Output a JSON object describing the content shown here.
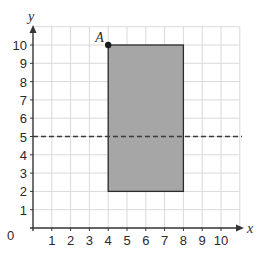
{
  "diagram": {
    "type": "coordinate-grid",
    "x_axis": {
      "label": "x",
      "min": 0,
      "max": 10,
      "ticks": [
        "1",
        "2",
        "3",
        "4",
        "5",
        "6",
        "7",
        "8",
        "9",
        "10"
      ]
    },
    "y_axis": {
      "label": "y",
      "min": 0,
      "max": 10,
      "ticks": [
        "1",
        "2",
        "3",
        "4",
        "5",
        "6",
        "7",
        "8",
        "9",
        "10"
      ]
    },
    "origin_label": "0",
    "grid_extent": {
      "x": 11,
      "y": 11
    },
    "rectangle": {
      "x1": 4,
      "y1": 2,
      "x2": 8,
      "y2": 10,
      "fill": "#a6a6a6",
      "stroke": "#2b2b2b"
    },
    "point": {
      "label": "A",
      "x": 4,
      "y": 10,
      "color": "#1a1a1a"
    },
    "dashed_line": {
      "y": 5,
      "color": "#3a3a3a"
    },
    "colors": {
      "grid": "#d9d9d9",
      "axis": "#333333"
    }
  }
}
